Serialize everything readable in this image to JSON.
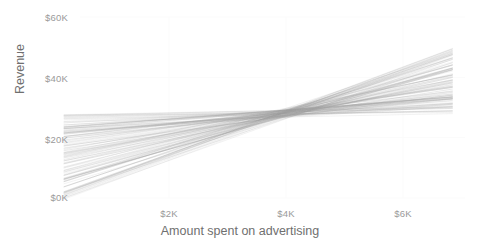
{
  "chart_data": {
    "type": "line",
    "title": "",
    "subtitle": "",
    "xlabel": "Amount spent on advertising",
    "ylabel": "Revenue",
    "xticks": [
      "$2K",
      "$4K",
      "$6K"
    ],
    "xtick_values": [
      2000,
      4000,
      6000
    ],
    "yticks": [
      "$0K",
      "$20K",
      "$40K",
      "$60K"
    ],
    "ytick_values": [
      0,
      20000,
      40000,
      60000
    ],
    "xlim": [
      200,
      6850
    ],
    "ylim": [
      -1500,
      61500
    ],
    "grid": true,
    "grid_style": "faint-light-gray",
    "legend": null,
    "legend_position": "none",
    "line_color": "#9b9b9b",
    "line_opacity": 0.22,
    "line_width": 0.7,
    "n_lines": 120,
    "pivot": {
      "x": 4000,
      "y": 28000
    },
    "annotations": [],
    "series": [
      {
        "name": "posterior-draw-low-slope",
        "slope_per_1k": 900,
        "x": [
          200,
          6850
        ],
        "values": [
          24580,
          30600
        ]
      },
      {
        "name": "posterior-draw-high-slope",
        "slope_per_1k": 7300,
        "x": [
          200,
          6850
        ],
        "values": [
          600,
          48800
        ]
      },
      {
        "name": "posterior-mean",
        "slope_per_1k": 4400,
        "x": [
          200,
          6850
        ],
        "values": [
          11280,
          40540
        ]
      }
    ],
    "endpoint_spread": {
      "left_x": 200,
      "left_y_min": 600,
      "left_y_max": 26500,
      "right_x": 6850,
      "right_y_min": 28200,
      "right_y_max": 57500
    }
  },
  "axis": {
    "y_ticks": [
      {
        "label": "$60K",
        "top": 12,
        "right": 68
      },
      {
        "label": "$40K",
        "top": 73,
        "right": 68
      },
      {
        "label": "$20K",
        "top": 134,
        "right": 68
      },
      {
        "label": "$0K",
        "top": 192,
        "right": 68
      }
    ],
    "x_ticks": [
      {
        "label": "$2K",
        "left": 144,
        "top": 208
      },
      {
        "label": "$4K",
        "left": 261,
        "top": 208
      },
      {
        "label": "$6K",
        "left": 378,
        "top": 208
      }
    ]
  }
}
